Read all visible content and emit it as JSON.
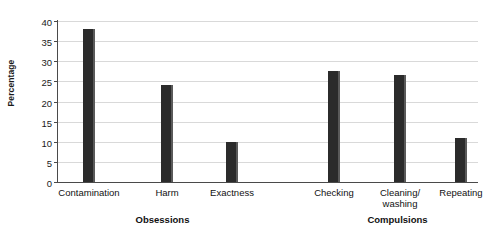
{
  "chart_data": {
    "type": "bar",
    "title": "",
    "xlabel": "",
    "ylabel": "Percentage",
    "ylim": [
      0,
      40
    ],
    "yticks": [
      0,
      5,
      10,
      15,
      20,
      25,
      30,
      35,
      40
    ],
    "grid": true,
    "legend": false,
    "bar_color": "#2b2b2b",
    "categories": [
      "Contamination",
      "Harm",
      "Exactness",
      "Checking",
      "Cleaning/\nwashing",
      "Repeating"
    ],
    "values": [
      38,
      24,
      10,
      27.5,
      26.5,
      11
    ],
    "groups": [
      {
        "label": "Obsessions",
        "categories": [
          "Contamination",
          "Harm",
          "Exactness"
        ]
      },
      {
        "label": "Compulsions",
        "categories": [
          "Checking",
          "Cleaning/\nwashing",
          "Repeating"
        ]
      }
    ]
  },
  "axis": {
    "y_title": "Percentage",
    "y_tick_labels": [
      "0",
      "5",
      "10",
      "15",
      "20",
      "25",
      "30",
      "35",
      "40"
    ]
  },
  "categories": [
    {
      "label": "Contamination",
      "value": 38
    },
    {
      "label": "Harm",
      "value": 24
    },
    {
      "label": "Exactness",
      "value": 10
    },
    {
      "label": "Checking",
      "value": 27.5
    },
    {
      "label": "Cleaning/\nwashing",
      "value": 26.5
    },
    {
      "label": "Repeating",
      "value": 11
    }
  ],
  "groups": [
    {
      "label": "Obsessions"
    },
    {
      "label": "Compulsions"
    }
  ]
}
